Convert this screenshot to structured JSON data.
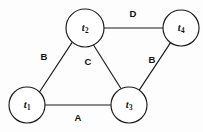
{
  "figure": {
    "type": "undirected-graph",
    "width": 203,
    "height": 132,
    "background_color": "#fdfdfd",
    "stroke_color": "#1a1a1a"
  },
  "nodes": [
    {
      "id": "t1",
      "letter": "t",
      "subscript": "1",
      "cx": 27,
      "cy": 105,
      "r": 18
    },
    {
      "id": "t2",
      "letter": "t",
      "subscript": "2",
      "cx": 85,
      "cy": 28,
      "r": 19
    },
    {
      "id": "t3",
      "letter": "t",
      "subscript": "3",
      "cx": 129,
      "cy": 105,
      "r": 18
    },
    {
      "id": "t4",
      "letter": "t",
      "subscript": "4",
      "cx": 181,
      "cy": 28,
      "r": 18
    }
  ],
  "edges": [
    {
      "id": "e-t1-t2",
      "from": "t1",
      "to": "t2",
      "label": "B",
      "label_x": 44,
      "label_y": 57
    },
    {
      "id": "e-t2-t3",
      "from": "t2",
      "to": "t3",
      "label": "C",
      "label_x": 88,
      "label_y": 62
    },
    {
      "id": "e-t2-t4",
      "from": "t2",
      "to": "t4",
      "label": "D",
      "label_x": 133,
      "label_y": 14
    },
    {
      "id": "e-t3-t4",
      "from": "t3",
      "to": "t4",
      "label": "B",
      "label_x": 152,
      "label_y": 60
    },
    {
      "id": "e-t1-t3",
      "from": "t1",
      "to": "t3",
      "label": "A",
      "label_x": 78,
      "label_y": 118
    }
  ]
}
